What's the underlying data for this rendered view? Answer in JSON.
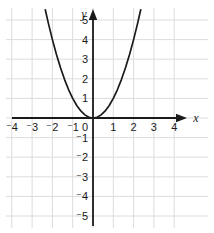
{
  "figure": {
    "background_color": "#ffffff",
    "grid_color": "#dcdcdc",
    "axis_color": "#1a1a1a",
    "curve_color": "#1a1a1a",
    "origin_label": "0",
    "x_axis_name": "x",
    "y_axis_name": "y"
  },
  "chart_data": {
    "type": "line",
    "title": "",
    "subtitle": "",
    "xlabel": "x",
    "ylabel": "y",
    "equation": "y = x^2",
    "xlim": [
      -4.6,
      4.6
    ],
    "ylim": [
      -5.4,
      5.6
    ],
    "grid": true,
    "legend": "none",
    "x_ticks": [
      -4,
      -3,
      -2,
      -1,
      1,
      2,
      3,
      4
    ],
    "y_ticks": [
      -5,
      -4,
      -3,
      -2,
      -1,
      1,
      2,
      3,
      4,
      5
    ],
    "x_tick_labels": [
      "⁻4",
      "⁻3",
      "⁻2",
      "⁻1",
      "1",
      "2",
      "3",
      "4"
    ],
    "y_tick_labels": [
      "⁻5",
      "⁻4",
      "⁻3",
      "⁻2",
      "⁻1",
      "1",
      "2",
      "3",
      "4",
      "5"
    ],
    "origin_tick_label": "0",
    "series": [
      {
        "name": "y = x^2",
        "x": [
          -2.35,
          -2.2,
          -2.0,
          -1.8,
          -1.6,
          -1.4,
          -1.2,
          -1.0,
          -0.8,
          -0.6,
          -0.4,
          -0.2,
          0,
          0.2,
          0.4,
          0.6,
          0.8,
          1.0,
          1.2,
          1.4,
          1.6,
          1.8,
          2.0,
          2.2,
          2.35
        ],
        "y": [
          5.52,
          4.84,
          4.0,
          3.24,
          2.56,
          1.96,
          1.44,
          1.0,
          0.64,
          0.36,
          0.16,
          0.04,
          0,
          0.04,
          0.16,
          0.36,
          0.64,
          1.0,
          1.44,
          1.96,
          2.56,
          3.24,
          4.0,
          4.84,
          5.52
        ]
      }
    ]
  }
}
